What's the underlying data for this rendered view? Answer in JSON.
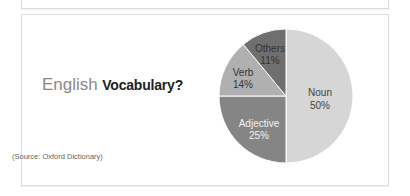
{
  "chart_data": {
    "type": "pie",
    "title": "English Vocabulary?",
    "title_parts": [
      "English",
      "Vocabulary?"
    ],
    "categories": [
      "Noun",
      "Adjective",
      "Verb",
      "Others"
    ],
    "values": [
      50,
      25,
      14,
      11
    ],
    "labels": [
      "50%",
      "25%",
      "14%",
      "11%"
    ],
    "colors": [
      "#d6d6d6",
      "#858585",
      "#b0b0b0",
      "#6f6f6f"
    ],
    "label_colors": [
      "#444444",
      "#f2f2f2",
      "#333333",
      "#333333"
    ],
    "start_angle_deg": 0,
    "direction": "clockwise",
    "source": "(Source: Oxford Dictionary)",
    "legend": "none"
  },
  "header": {
    "title_main": "English",
    "title_sub": "Vocabulary?"
  },
  "footer": {
    "source": "(Source: Oxford Dictionary)"
  },
  "slices": [
    {
      "name": "Noun",
      "pct": "50%"
    },
    {
      "name": "Adjective",
      "pct": "25%"
    },
    {
      "name": "Verb",
      "pct": "14%"
    },
    {
      "name": "Others",
      "pct": "11%"
    }
  ]
}
